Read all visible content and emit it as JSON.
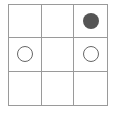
{
  "board": {
    "rows": 3,
    "cols": 3,
    "grid_color": "#9a9a9a",
    "cells": [
      {
        "row": 0,
        "col": 0,
        "piece": "empty"
      },
      {
        "row": 0,
        "col": 1,
        "piece": "empty"
      },
      {
        "row": 0,
        "col": 2,
        "piece": "filled"
      },
      {
        "row": 1,
        "col": 0,
        "piece": "hollow"
      },
      {
        "row": 1,
        "col": 1,
        "piece": "empty"
      },
      {
        "row": 1,
        "col": 2,
        "piece": "hollow"
      },
      {
        "row": 2,
        "col": 0,
        "piece": "empty"
      },
      {
        "row": 2,
        "col": 1,
        "piece": "empty"
      },
      {
        "row": 2,
        "col": 2,
        "piece": "empty"
      }
    ],
    "piece_colors": {
      "filled": "#555555",
      "hollow": "#666666"
    }
  }
}
